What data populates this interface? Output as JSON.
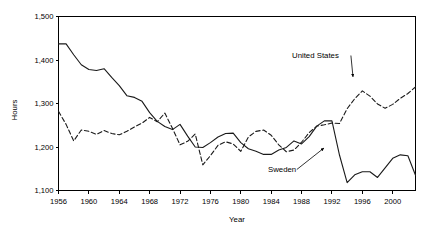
{
  "chart_data": {
    "type": "line",
    "title": "",
    "xlabel": "Year",
    "ylabel": "Hours",
    "xlim": [
      1956,
      2003
    ],
    "ylim": [
      1100,
      1500
    ],
    "grid": false,
    "legend_position": "inline-annotations",
    "x_ticks": [
      "1956",
      "1960",
      "1964",
      "1968",
      "1972",
      "1976",
      "1980",
      "1984",
      "1988",
      "1992",
      "1996",
      "2000"
    ],
    "x_tick_values": [
      1956,
      1960,
      1964,
      1968,
      1972,
      1976,
      1980,
      1984,
      1988,
      1992,
      1996,
      2000
    ],
    "y_ticks": [
      "1,100",
      "1,200",
      "1,300",
      "1,400",
      "1,500"
    ],
    "y_tick_values": [
      1100,
      1200,
      1300,
      1400,
      1500
    ],
    "x": [
      1956,
      1957,
      1958,
      1959,
      1960,
      1961,
      1962,
      1963,
      1964,
      1965,
      1966,
      1967,
      1968,
      1969,
      1970,
      1971,
      1972,
      1973,
      1974,
      1975,
      1976,
      1977,
      1978,
      1979,
      1980,
      1981,
      1982,
      1983,
      1984,
      1985,
      1986,
      1987,
      1988,
      1989,
      1990,
      1991,
      1992,
      1993,
      1994,
      1995,
      1996,
      1997,
      1998,
      1999,
      2000,
      2001,
      2002,
      2003
    ],
    "series": [
      {
        "name": "Sweden",
        "style": "solid",
        "values": [
          1437,
          1437,
          1412,
          1389,
          1378,
          1376,
          1380,
          1360,
          1341,
          1318,
          1314,
          1305,
          1279,
          1259,
          1247,
          1240,
          1252,
          1225,
          1200,
          1199,
          1210,
          1223,
          1231,
          1232,
          1210,
          1196,
          1190,
          1183,
          1183,
          1193,
          1199,
          1214,
          1207,
          1224,
          1248,
          1260,
          1260,
          1181,
          1118,
          1136,
          1143,
          1143,
          1130,
          1152,
          1174,
          1182,
          1180,
          1135
        ]
      },
      {
        "name": "United States",
        "style": "dashed",
        "values": [
          1282,
          1252,
          1214,
          1239,
          1236,
          1229,
          1238,
          1231,
          1228,
          1236,
          1246,
          1255,
          1268,
          1258,
          1278,
          1243,
          1205,
          1213,
          1230,
          1159,
          1180,
          1204,
          1212,
          1207,
          1190,
          1223,
          1236,
          1239,
          1227,
          1205,
          1189,
          1193,
          1211,
          1233,
          1248,
          1251,
          1255,
          1254,
          1288,
          1311,
          1329,
          1317,
          1299,
          1289,
          1298,
          1312,
          1323,
          1338
        ]
      }
    ],
    "annotations": [
      {
        "id": "united-states",
        "text": "United States",
        "label_x": 292,
        "label_y": 58,
        "arrow_to_x": 353,
        "arrow_to_y": 77
      },
      {
        "id": "sweden",
        "text": "Sweden",
        "label_x": 268,
        "label_y": 172,
        "arrow_to_x": 324,
        "arrow_to_y": 148
      }
    ]
  }
}
